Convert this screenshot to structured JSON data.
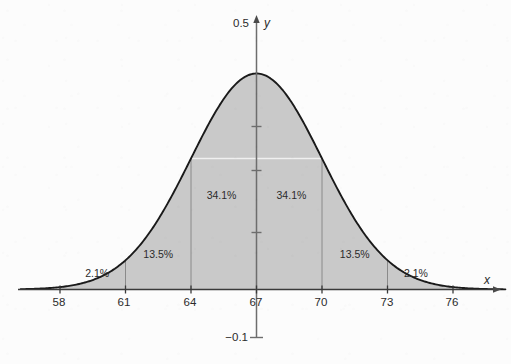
{
  "chart_data": {
    "type": "area",
    "title": "",
    "subtitle": "",
    "xlabel": "x",
    "ylabel": "y",
    "grid": false,
    "legend": "none",
    "distribution": "normal",
    "mean": 67,
    "std_dev": 3,
    "xlim": [
      56.2,
      78.4
    ],
    "ylim": [
      -0.1,
      0.5
    ],
    "y_axis_endpoints": {
      "top_label": "0.5",
      "bottom_label": "−0.1"
    },
    "x_ticks": [
      58,
      61,
      64,
      67,
      70,
      73,
      76
    ],
    "x_tick_labels": [
      "58",
      "61",
      "64",
      "67",
      "70",
      "73",
      "76"
    ],
    "y_tick_count": 3,
    "shaded_region": {
      "from": 58,
      "to": 76,
      "fill_color": "#c9c9c9"
    },
    "curve_color": "#1a1a1a",
    "axis_color": "#4a4a4a",
    "divider_color": "#8a8a8a",
    "band_dividers": [
      61,
      64,
      70,
      73
    ],
    "bands": [
      {
        "label": "2.1%",
        "from": 58,
        "to": 61,
        "value": 2.1,
        "label_x": 59.7,
        "label_y_px": 277
      },
      {
        "label": "13.5%",
        "from": 61,
        "to": 64,
        "value": 13.5,
        "label_x": 62.5,
        "label_y_px": 258
      },
      {
        "label": "34.1%",
        "from": 64,
        "to": 67,
        "value": 34.1,
        "label_x": 65.4,
        "label_y_px": 199
      },
      {
        "label": "34.1%",
        "from": 67,
        "to": 70,
        "value": 34.1,
        "label_x": 68.6,
        "label_y_px": 199
      },
      {
        "label": "13.5%",
        "from": 70,
        "to": 73,
        "value": 13.5,
        "label_x": 71.5,
        "label_y_px": 258
      },
      {
        "label": "2.1%",
        "from": 73,
        "to": 76,
        "value": 2.1,
        "label_x": 74.3,
        "label_y_px": 277
      }
    ]
  },
  "labels": {
    "y_top": "0.5",
    "y_bottom": "−0.1",
    "axis_x": "x",
    "axis_y": "y",
    "x58": "58",
    "x61": "61",
    "x64": "64",
    "x67": "67",
    "x70": "70",
    "x73": "73",
    "x76": "76",
    "pct_2_1_left": "2.1%",
    "pct_13_5_left": "13.5%",
    "pct_34_1_left": "34.1%",
    "pct_34_1_right": "34.1%",
    "pct_13_5_right": "13.5%",
    "pct_2_1_right": "2.1%"
  }
}
